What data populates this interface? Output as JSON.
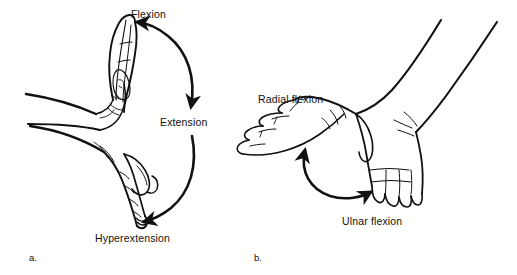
{
  "figure": {
    "background_color": "#fffffd",
    "ink_color": "#111111",
    "width": 517,
    "height": 275
  },
  "panels": [
    {
      "letter": "a.",
      "caption": "Wrist flexion, extension and hyperextension (sagittal plane)",
      "labels": [
        {
          "name": "flexion",
          "text": "Flexion"
        },
        {
          "name": "extension",
          "text": "Extension"
        },
        {
          "name": "hyperextension",
          "text": "Hyperextension"
        }
      ],
      "arrows": [
        {
          "name": "flexion-arrow",
          "double_headed": true,
          "from_label": "Extension",
          "to_label": "Flexion"
        },
        {
          "name": "hyperextension-arrow",
          "double_headed": false,
          "from_label": "Extension",
          "to_label": "Hyperextension"
        }
      ],
      "hands": [
        {
          "name": "hand-flexed",
          "posture": "flexed upward"
        },
        {
          "name": "hand-hyperextended",
          "posture": "hyperextended downward"
        }
      ]
    },
    {
      "letter": "b.",
      "caption": "Wrist radial and ulnar flexion (frontal plane)",
      "labels": [
        {
          "name": "radial-flexion",
          "text": "Radial flexion"
        },
        {
          "name": "ulnar-flexion",
          "text": "Ulnar flexion"
        }
      ],
      "arrows": [
        {
          "name": "radial-ulnar-arrow",
          "double_headed": true,
          "from_label": "Ulnar flexion",
          "to_label": "Radial flexion"
        }
      ],
      "hands": [
        {
          "name": "hand-radial-deviated",
          "posture": "deviated toward thumb side"
        },
        {
          "name": "hand-ulnar-deviated",
          "posture": "deviated toward little finger side"
        }
      ]
    }
  ]
}
